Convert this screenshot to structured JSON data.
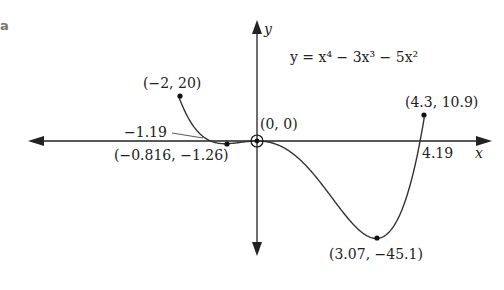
{
  "part_label": "a",
  "chart_data": {
    "type": "line",
    "function": "x^4 - 3x^3 - 5x^2",
    "xlabel": "x",
    "ylabel": "y",
    "domain": [
      -2,
      4.3
    ],
    "grid": false,
    "points": [
      {
        "x": -2,
        "y": 20,
        "label": "(−2, 20)"
      },
      {
        "x": -0.816,
        "y": -1.26,
        "label": "(−0.816, −1.26)"
      },
      {
        "x": 0,
        "y": 0,
        "label": "(0, 0)"
      },
      {
        "x": 3.07,
        "y": -45.1,
        "label": "(3.07, −45.1)"
      },
      {
        "x": 4.3,
        "y": 10.9,
        "label": "(4.3, 10.9)"
      }
    ],
    "x_intercepts": [
      {
        "x": -1.19,
        "label": "−1.19"
      },
      {
        "x": 0,
        "label": "(0, 0)"
      },
      {
        "x": 4.19,
        "label": "4.19"
      }
    ]
  },
  "labels": {
    "equation_y": "y",
    "equation_eq": " = ",
    "equation": "y = x⁴ − 3x³ − 5x²",
    "x_axis": "x",
    "y_axis": "y",
    "p_neg2": "(−2, 20)",
    "p_min1": "(−0.816, −1.26)",
    "p_origin": "(0, 0)",
    "p_min2": "(3.07, −45.1)",
    "p_end": "(4.3, 10.9)",
    "int_neg": "−1.19",
    "int_pos": "4.19"
  }
}
